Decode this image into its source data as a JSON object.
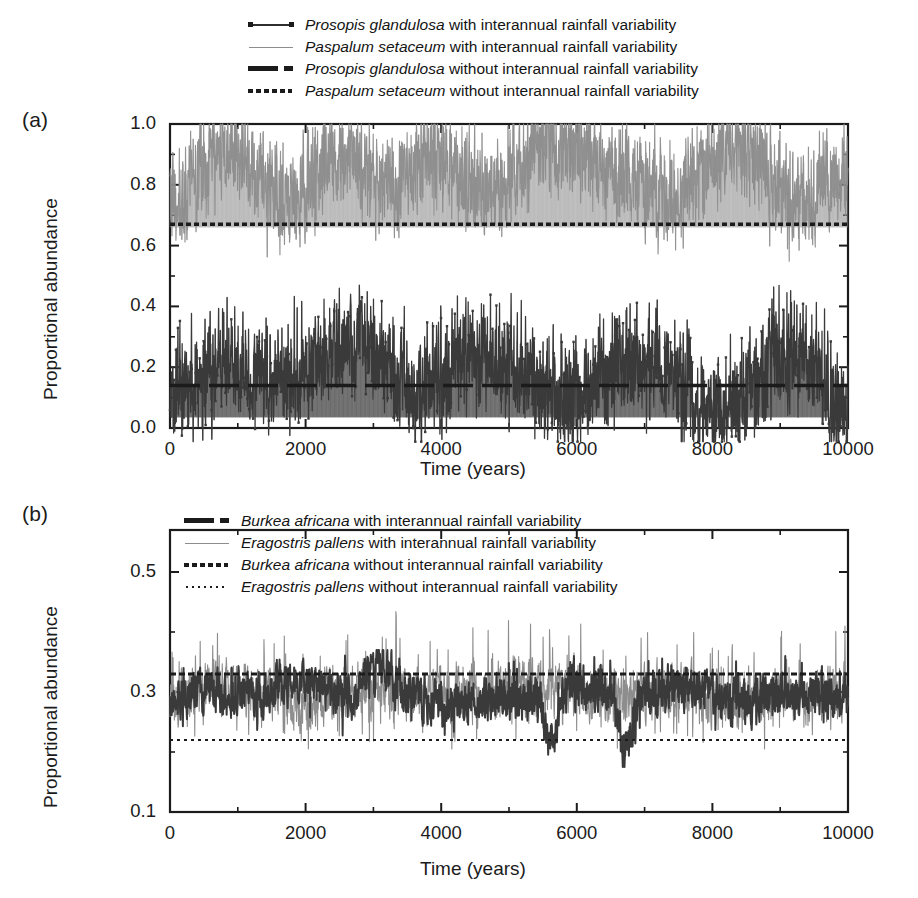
{
  "figure": {
    "panels": [
      {
        "id": "a",
        "label": "(a)",
        "ylabel": "Proportional abundance",
        "xlabel": "Time (years)",
        "yticks": [
          "0.0",
          "0.2",
          "0.4",
          "0.6",
          "0.8",
          "1.0"
        ],
        "xticks": [
          "0",
          "2000",
          "4000",
          "6000",
          "8000",
          "10000"
        ],
        "legend": [
          {
            "style": "line-marker",
            "species": "Prosopis glandulosa",
            "rest": " with interannual rainfall variability"
          },
          {
            "style": "thin-gray",
            "species": "Paspalum setaceum",
            "rest": " with interannual rainfall variability"
          },
          {
            "style": "thick-dash",
            "species": "Prosopis glandulosa",
            "rest": " without interannual rainfall variability"
          },
          {
            "style": "thick-dot",
            "species": "Paspalum setaceum",
            "rest": " without interannual rainfall variability"
          }
        ]
      },
      {
        "id": "b",
        "label": "(b)",
        "ylabel": "Proportional abundance",
        "xlabel": "Time (years)",
        "yticks": [
          "0.1",
          "0.3",
          "0.5"
        ],
        "xticks": [
          "0",
          "2000",
          "4000",
          "6000",
          "8000",
          "10000"
        ],
        "legend": [
          {
            "style": "thick-dash",
            "species": "Burkea africana",
            "rest": " with interannual rainfall variability"
          },
          {
            "style": "thin-gray",
            "species": "Eragostris pallens",
            "rest": " with interannual rainfall variability"
          },
          {
            "style": "thick-dot",
            "species": "Burkea africana",
            "rest": " without interannual rainfall variability"
          },
          {
            "style": "thin-dot",
            "species": "Eragostris pallens",
            "rest": " without interannual rainfall variability"
          }
        ]
      }
    ]
  },
  "colors": {
    "ink": "#1b1b1b",
    "dark_series": "#3a3a3a",
    "gray_series": "#8d8d8d",
    "frame": "#1b1b1b",
    "background": "#ffffff"
  },
  "chart_data": [
    {
      "type": "line",
      "panel": "a",
      "title": "",
      "xlabel": "Time (years)",
      "ylabel": "Proportional abundance",
      "xlim": [
        0,
        10000
      ],
      "ylim": [
        0.0,
        1.0
      ],
      "yticks": [
        0.0,
        0.2,
        0.4,
        0.6,
        0.8,
        1.0
      ],
      "xticks": [
        0,
        2000,
        4000,
        6000,
        8000,
        10000
      ],
      "grid": false,
      "legend_position": "above-axes",
      "series": [
        {
          "name": "Prosopis glandulosa with interannual rainfall variability",
          "style": "noisy-line-with-markers",
          "color": "#3a3a3a",
          "mean": 0.17,
          "range": [
            -0.04,
            0.47
          ],
          "note": "dense high-frequency oscillation, lower band of the plot"
        },
        {
          "name": "Paspalum setaceum with interannual rainfall variability",
          "style": "noisy-thin-line",
          "color": "#8d8d8d",
          "mean": 0.83,
          "range": [
            0.5,
            1.0
          ],
          "note": "dense high-frequency oscillation, upper band of the plot"
        },
        {
          "name": "Prosopis glandulosa without interannual rainfall variability",
          "style": "dashed-constant",
          "color": "#1b1b1b",
          "constant": 0.14
        },
        {
          "name": "Paspalum setaceum without interannual rainfall variability",
          "style": "dotted-constant",
          "color": "#1b1b1b",
          "constant": 0.67
        }
      ]
    },
    {
      "type": "line",
      "panel": "b",
      "title": "",
      "xlabel": "Time (years)",
      "ylabel": "Proportional abundance",
      "xlim": [
        0,
        10000
      ],
      "ylim": [
        0.1,
        0.57
      ],
      "yticks": [
        0.1,
        0.3,
        0.5
      ],
      "xticks": [
        0,
        2000,
        4000,
        6000,
        8000,
        10000
      ],
      "grid": false,
      "legend_position": "inside-top-left",
      "series": [
        {
          "name": "Burkea africana with interannual rainfall variability",
          "style": "noisy-line",
          "color": "#3a3a3a",
          "mean": 0.295,
          "range": [
            0.18,
            0.36
          ],
          "note": "thicker dark trace, dips to ~0.18 near t=5600 and t=6700"
        },
        {
          "name": "Eragostris pallens with interannual rainfall variability",
          "style": "noisy-thin-line",
          "color": "#8d8d8d",
          "mean": 0.3,
          "range": [
            0.2,
            0.5
          ],
          "note": "thin trace with upward spikes to ~0.47-0.50 near t=4300 and t=6400"
        },
        {
          "name": "Burkea africana without interannual rainfall variability",
          "style": "dotted-constant-thick",
          "color": "#1b1b1b",
          "constant": 0.33
        },
        {
          "name": "Eragostris pallens without interannual rainfall variability",
          "style": "dotted-constant-thin",
          "color": "#1b1b1b",
          "constant": 0.22
        }
      ]
    }
  ]
}
